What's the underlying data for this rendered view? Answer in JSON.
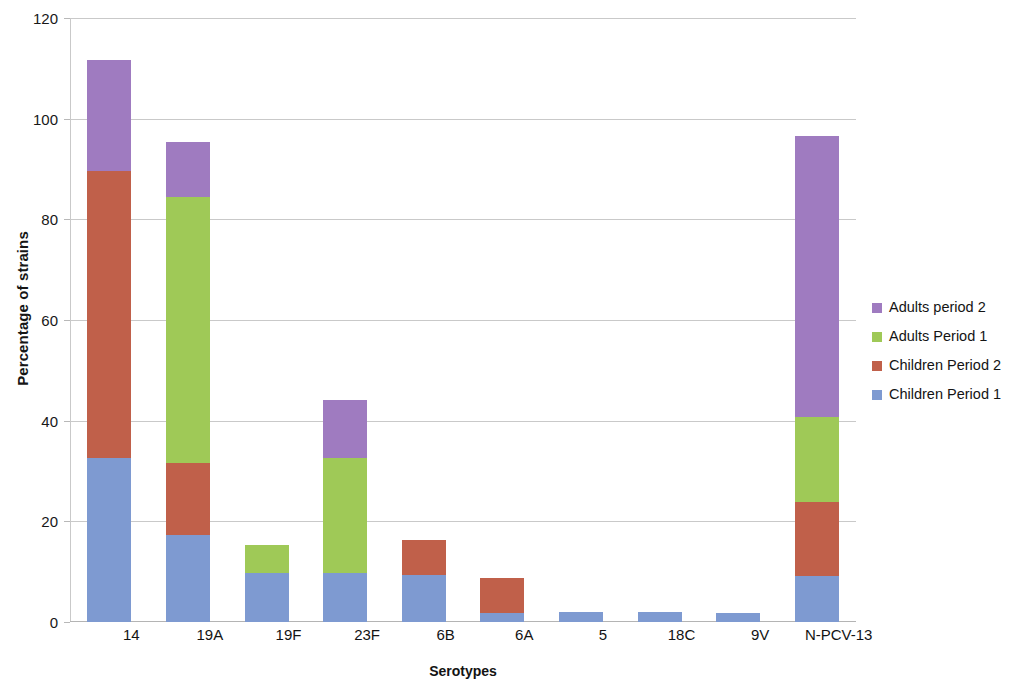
{
  "chart_data": {
    "type": "bar",
    "subtype": "stacked-bar",
    "title": "",
    "xlabel": "Serotypes",
    "ylabel": "Percentage of strains",
    "ylim": [
      0,
      120
    ],
    "yticks": [
      0,
      20,
      40,
      60,
      80,
      100,
      120
    ],
    "ytick_labels": [
      "0",
      "20",
      "40",
      "60",
      "80",
      "100",
      "120"
    ],
    "grid": true,
    "legend_position": "right",
    "categories": [
      "14",
      "19A",
      "19F",
      "23F",
      "6B",
      "6A",
      "5",
      "18C",
      "9V",
      "N-PCV-13"
    ],
    "series": [
      {
        "name": "Children Period 1",
        "color": "#7e9ad1",
        "values": [
          32.5,
          17.3,
          9.7,
          9.7,
          9.3,
          1.8,
          2.0,
          1.9,
          1.8,
          9.1
        ]
      },
      {
        "name": "Children Period 2",
        "color": "#c0604a",
        "values": [
          57.2,
          14.3,
          0,
          0,
          7.0,
          6.9,
          0,
          0,
          0,
          14.7
        ]
      },
      {
        "name": "Adults Period 1",
        "color": "#9fc957",
        "values": [
          0,
          52.8,
          5.6,
          22.9,
          0,
          0,
          0,
          0,
          0,
          16.9
        ]
      },
      {
        "name": "Adults  period 2",
        "color": "#9f7bc0",
        "values": [
          22.0,
          11.0,
          0,
          11.5,
          0,
          0,
          0,
          0,
          0,
          55.9
        ]
      }
    ],
    "totals": [
      111.7,
      95.4,
      15.3,
      44.1,
      16.3,
      8.7,
      2.0,
      1.9,
      1.8,
      96.6
    ]
  },
  "legend": {
    "items": [
      {
        "label": "Adults  period 2",
        "color": "#9f7bc0"
      },
      {
        "label": "Adults Period 1",
        "color": "#9fc957"
      },
      {
        "label": "Children Period 2",
        "color": "#c0604a"
      },
      {
        "label": "Children Period 1",
        "color": "#7e9ad1"
      }
    ]
  },
  "axes": {
    "y_title": "Percentage of strains",
    "x_title": "Serotypes"
  }
}
